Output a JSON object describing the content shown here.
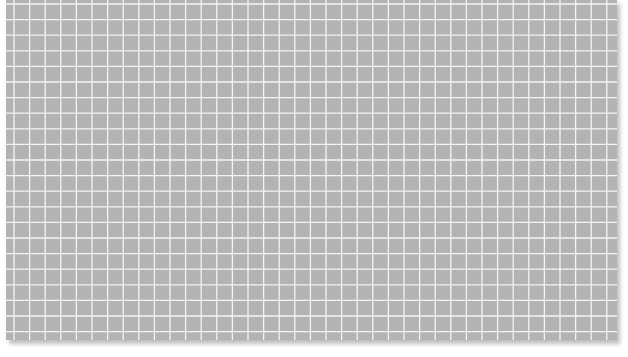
{
  "sheet": {
    "background_color": "#b3b3b3",
    "line_color": "#f4f4f4",
    "cell_size_px": 15.6,
    "columns": 39,
    "rows": 22
  }
}
